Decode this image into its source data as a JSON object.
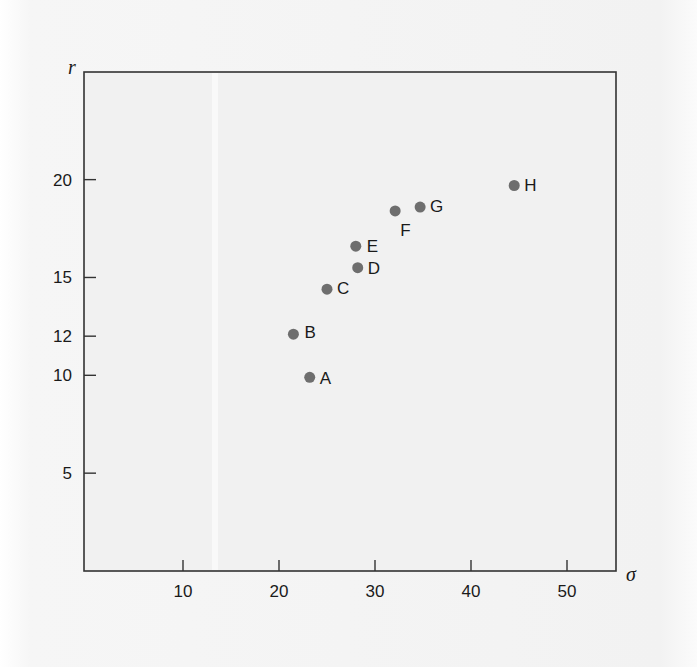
{
  "chart_data": {
    "type": "scatter",
    "title": "",
    "xlabel": "σ",
    "ylabel": "r",
    "xlim": [
      0,
      55
    ],
    "ylim": [
      0,
      25.5
    ],
    "grid": false,
    "legend": null,
    "x_ticks": [
      10,
      20,
      30,
      40,
      50
    ],
    "y_ticks": [
      5,
      10,
      12,
      15,
      20
    ],
    "points": [
      {
        "label": "A",
        "x": 23.2,
        "y": 9.9
      },
      {
        "label": "B",
        "x": 21.5,
        "y": 12.1
      },
      {
        "label": "C",
        "x": 25.0,
        "y": 14.4
      },
      {
        "label": "D",
        "x": 28.2,
        "y": 15.5
      },
      {
        "label": "E",
        "x": 28.0,
        "y": 16.6
      },
      {
        "label": "F",
        "x": 32.1,
        "y": 18.4
      },
      {
        "label": "G",
        "x": 34.7,
        "y": 18.6
      },
      {
        "label": "H",
        "x": 44.5,
        "y": 19.7
      }
    ],
    "label_offsets": {
      "A": [
        10,
        7
      ],
      "B": [
        11,
        4
      ],
      "C": [
        10,
        5
      ],
      "D": [
        10,
        6
      ],
      "E": [
        11,
        6
      ],
      "F": [
        5,
        25
      ],
      "G": [
        10,
        5
      ],
      "H": [
        10,
        6
      ]
    },
    "colors": {
      "marker": "#6e6e6e",
      "axis": "#333333",
      "plot_bg": "#f1f1f1"
    }
  }
}
